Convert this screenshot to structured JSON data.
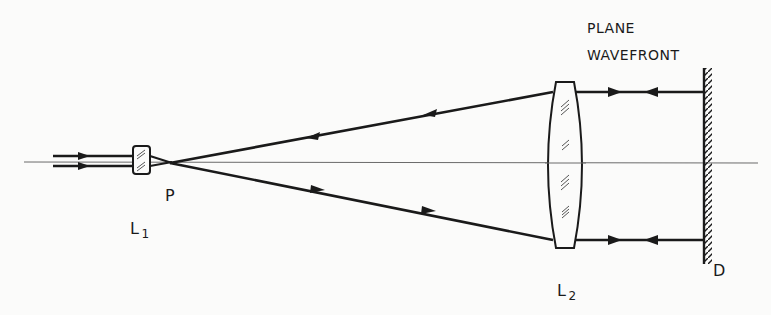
{
  "diagram": {
    "labels": {
      "plane_wavefront_line1": "PLANE",
      "plane_wavefront_line2": "WAVEFRONT",
      "lens1": "L",
      "lens1_sub": "1",
      "focal_point": "P",
      "lens2": "L",
      "lens2_sub": "2",
      "mirror": "D"
    },
    "components": [
      {
        "id": "input-beam",
        "type": "collimated beam",
        "direction": "left-to-right"
      },
      {
        "id": "L1",
        "type": "small converging lens"
      },
      {
        "id": "P",
        "type": "focal point"
      },
      {
        "id": "L2",
        "type": "large collimating lens"
      },
      {
        "id": "D",
        "type": "plane mirror"
      }
    ],
    "colors": {
      "ink": "#1a1a1a",
      "axis": "#6a6a6a",
      "background": "#fbfbfa"
    }
  }
}
